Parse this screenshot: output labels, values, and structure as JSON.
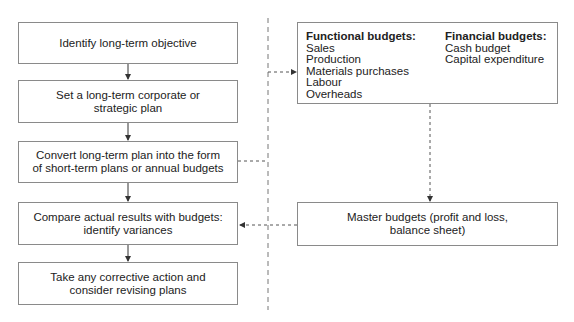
{
  "flow": {
    "steps": [
      {
        "line1": "Identify long-term objective",
        "line2": ""
      },
      {
        "line1": "Set a long-term corporate or",
        "line2": "strategic plan"
      },
      {
        "line1": "Convert long-term plan into the form",
        "line2": "of short-term plans or annual budgets"
      },
      {
        "line1": "Compare actual results with budgets:",
        "line2": "identify variances"
      },
      {
        "line1": "Take any corrective action and",
        "line2": "consider revising plans"
      }
    ]
  },
  "budgets": {
    "functional": {
      "heading": "Functional budgets:",
      "items": [
        "Sales",
        "Production",
        "Materials purchases",
        "Labour",
        "Overheads"
      ]
    },
    "financial": {
      "heading": "Financial budgets:",
      "items": [
        "Cash budget",
        "Capital expenditure"
      ]
    }
  },
  "master": {
    "line1": "Master budgets (profit and loss,",
    "line2": "balance sheet)"
  }
}
